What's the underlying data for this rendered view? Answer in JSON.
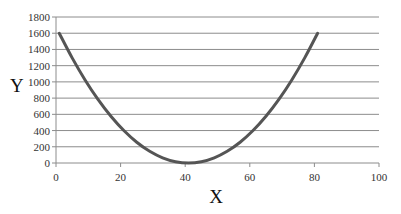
{
  "chart_data": {
    "type": "line",
    "title": "",
    "xlabel": "X",
    "ylabel": "Y",
    "xlim": [
      0,
      100
    ],
    "ylim": [
      0,
      1800
    ],
    "x_ticks": [
      0,
      20,
      40,
      60,
      80,
      100
    ],
    "y_ticks": [
      0,
      200,
      400,
      600,
      800,
      1000,
      1200,
      1400,
      1600,
      1800
    ],
    "grid": {
      "horizontal": true,
      "vertical": false
    },
    "legend": null,
    "series": [
      {
        "name": "Y",
        "color": "#555555",
        "x": [
          1,
          5,
          9,
          13,
          17,
          21,
          25,
          29,
          33,
          37,
          41,
          45,
          49,
          53,
          57,
          61,
          65,
          69,
          73,
          77,
          81
        ],
        "values": [
          1600,
          1296,
          1024,
          784,
          576,
          400,
          256,
          144,
          64,
          16,
          0,
          16,
          64,
          144,
          256,
          400,
          576,
          784,
          1024,
          1296,
          1600
        ]
      }
    ]
  },
  "colors": {
    "gridline": "#8c8c8c",
    "axis": "#8c8c8c",
    "line": "#555555"
  }
}
